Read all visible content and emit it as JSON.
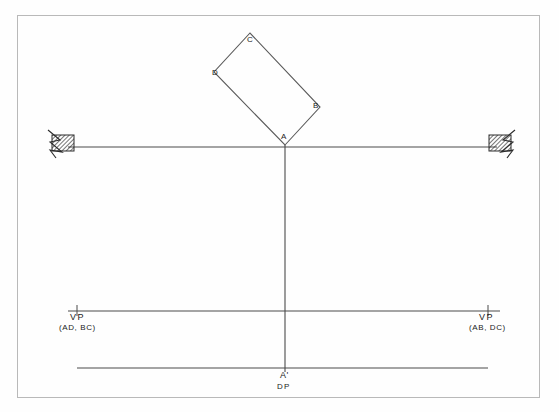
{
  "drawing": {
    "title": "Two-point perspective construction of a rectangle",
    "frame": {
      "stroke": "#b9b9b9",
      "x": 17,
      "y": 15,
      "width": 523,
      "height": 383
    },
    "colors": {
      "line": "#4a4a4a",
      "line_light": "#6d6d6d",
      "hatch": "#2b2b2b",
      "text": "#1c1c1c",
      "background": "#fefefe"
    },
    "rectangle": {
      "name": "plan-rectangle-ABCD",
      "vertices": [
        {
          "id": "A",
          "label": "A",
          "x": 285,
          "y": 145
        },
        {
          "id": "B",
          "label": "B",
          "x": 320,
          "y": 107
        },
        {
          "id": "C",
          "label": "C",
          "x": 250,
          "y": 33
        },
        {
          "id": "D",
          "label": "D",
          "x": 214,
          "y": 72
        }
      ],
      "label_offsets": [
        {
          "id": "A",
          "x": 281,
          "y": 132
        },
        {
          "id": "B",
          "x": 313,
          "y": 102
        },
        {
          "id": "C",
          "x": 248,
          "y": 36
        },
        {
          "id": "D",
          "x": 213,
          "y": 69
        }
      ]
    },
    "picture_line": {
      "name": "picture-plane-line",
      "x1": 68,
      "y1": 147,
      "x2": 497,
      "y2": 147
    },
    "horizon_line": {
      "name": "horizon-line",
      "x1": 68,
      "y1": 311,
      "x2": 500,
      "y2": 311
    },
    "ground_line": {
      "name": "ground-line",
      "x1": 77,
      "y1": 368,
      "x2": 488,
      "y2": 368
    },
    "vertical_line": {
      "name": "station-point-vertical",
      "x1": 285,
      "y1": 145,
      "x2": 285,
      "y2": 372
    },
    "station_symbols": [
      {
        "id": "left",
        "name": "left-break-symbol",
        "x": 52,
        "y": 135,
        "width": 22,
        "height": 17,
        "flip": false
      },
      {
        "id": "right",
        "name": "right-break-symbol",
        "x": 489,
        "y": 135,
        "width": 22,
        "height": 17,
        "flip": true
      }
    ],
    "vp_ticks": [
      {
        "id": "left",
        "x": 77,
        "y": 311
      },
      {
        "id": "right",
        "x": 488,
        "y": 311
      }
    ]
  },
  "labels": {
    "vp_left": {
      "title": "VP",
      "subtitle": "(AD, BC)",
      "title_x": 70,
      "title_y": 313,
      "subtitle_x": 60,
      "subtitle_y": 324
    },
    "vp_right": {
      "title": "VP",
      "subtitle": "(AB, DC)",
      "title_x": 478,
      "title_y": 313,
      "subtitle_x": 469,
      "subtitle_y": 324
    },
    "station_point": {
      "title": "A'",
      "subtitle": "DP",
      "title_x": 280,
      "title_y": 371,
      "subtitle_x": 277,
      "subtitle_y": 383
    }
  }
}
